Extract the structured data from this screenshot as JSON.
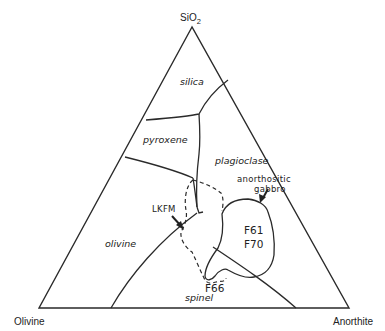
{
  "diagram": {
    "type": "ternary-phase-diagram",
    "vertices": {
      "top": {
        "label": "SiO",
        "subscript": "2"
      },
      "bottom_left": {
        "label": "Olivine"
      },
      "bottom_right": {
        "label": "Anorthite"
      }
    },
    "fields": [
      {
        "id": "silica",
        "label": "silica"
      },
      {
        "id": "pyroxene",
        "label": "pyroxene"
      },
      {
        "id": "plagioclase",
        "label": "plagioclase"
      },
      {
        "id": "olivine",
        "label": "olivine"
      },
      {
        "id": "spinel",
        "label": "spinel"
      }
    ],
    "annotations": {
      "lkfm": "LKFM",
      "gabbro_line1": "anorthositic",
      "gabbro_line2": "gabbro",
      "sample_f61": "F61",
      "sample_f70": "F70",
      "sample_f66": "F66"
    },
    "colors": {
      "line": "#2a2a2a",
      "background": "#ffffff"
    }
  }
}
